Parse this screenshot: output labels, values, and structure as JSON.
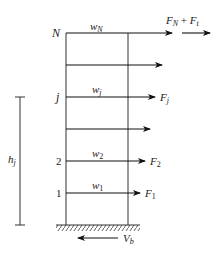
{
  "diagram": {
    "levels": [
      {
        "id": "N",
        "level_label": "N",
        "weight": {
          "base": "w",
          "sub": "N"
        },
        "force": {
          "base": "F",
          "sub": "N",
          "extra_base": "F",
          "extra_sub": "t",
          "joiner": " + "
        }
      },
      {
        "id": "n-1",
        "level_label": "",
        "weight": null,
        "force": null
      },
      {
        "id": "j",
        "level_label": "j",
        "weight": {
          "base": "w",
          "sub": "j"
        },
        "force": {
          "base": "F",
          "sub": "j"
        }
      },
      {
        "id": "j-1",
        "level_label": "",
        "weight": null,
        "force": null
      },
      {
        "id": "2",
        "level_label": "2",
        "weight": {
          "base": "w",
          "sub": "2"
        },
        "force": {
          "base": "F",
          "sub": "2"
        }
      },
      {
        "id": "1",
        "level_label": "1",
        "weight": {
          "base": "w",
          "sub": "1"
        },
        "force": {
          "base": "F",
          "sub": "1"
        }
      }
    ],
    "height_dimension": {
      "base": "h",
      "sub": "j"
    },
    "base_shear": {
      "base": "V",
      "sub": "b"
    },
    "colors": {
      "structure": "#333333",
      "arrows": "#111111",
      "text": "#222222"
    }
  }
}
